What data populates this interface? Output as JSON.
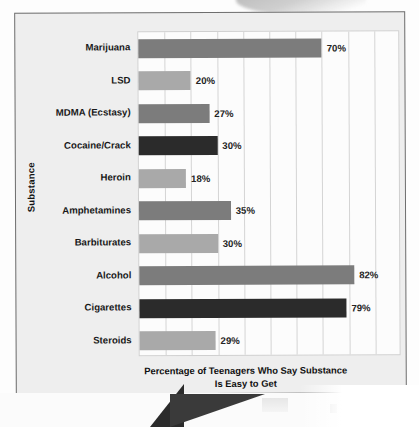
{
  "chart_data": {
    "type": "bar",
    "orientation": "horizontal",
    "title": "",
    "xlabel": "Percentage of Teenagers Who Say Substance Is Easy to Get",
    "xlabel_line1": "Percentage of Teenagers Who Say Substance",
    "xlabel_line2": "Is Easy to Get",
    "ylabel": "Substance",
    "categories": [
      "Marijuana",
      "LSD",
      "MDMA (Ecstasy)",
      "Cocaine/Crack",
      "Heroin",
      "Amphetamines",
      "Barbiturates",
      "Alcohol",
      "Cigarettes",
      "Steroids"
    ],
    "values": [
      70,
      20,
      27,
      30,
      18,
      35,
      30,
      82,
      79,
      29
    ],
    "value_labels": [
      "70%",
      "20%",
      "27%",
      "30%",
      "18%",
      "35%",
      "30%",
      "82%",
      "79%",
      "29%"
    ],
    "bar_colors": [
      "#7c7c7c",
      "#a9a9a9",
      "#7c7c7c",
      "#2b2b2b",
      "#a9a9a9",
      "#7c7c7c",
      "#a9a9a9",
      "#7c7c7c",
      "#2b2b2b",
      "#a9a9a9"
    ],
    "xlim": [
      0,
      100
    ],
    "gridlines": [
      10,
      20,
      30,
      40,
      50,
      60,
      70,
      80,
      90
    ],
    "grid": true,
    "legend": "none",
    "x_tick_labels_shown": false
  },
  "theme": {
    "card_background": "#eeeeee",
    "card_border": "#6e6e6e",
    "plot_background": "#fcfcfc",
    "gridline_color": "#d4d4d4",
    "text_color": "#181818"
  }
}
